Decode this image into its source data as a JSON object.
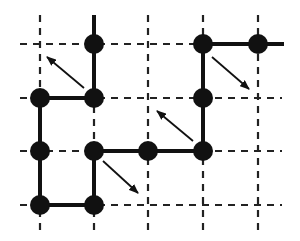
{
  "diagram": {
    "type": "lattice-polymer-chain-moves",
    "colors": {
      "background": "#ffffff",
      "ink": "#111111",
      "grid": "#222222"
    },
    "grid": {
      "columns_x": [
        40,
        94,
        148,
        203,
        258
      ],
      "rows_y": [
        44,
        98,
        151,
        205
      ],
      "x_extent": [
        20,
        282
      ],
      "y_extent": [
        15,
        230
      ],
      "style": "dashed"
    },
    "nodes": [
      {
        "id": "n1",
        "x": 94,
        "y": 44
      },
      {
        "id": "n2",
        "x": 94,
        "y": 98
      },
      {
        "id": "n3",
        "x": 40,
        "y": 98
      },
      {
        "id": "n4",
        "x": 40,
        "y": 151
      },
      {
        "id": "n5",
        "x": 40,
        "y": 205
      },
      {
        "id": "n6",
        "x": 94,
        "y": 205
      },
      {
        "id": "n7",
        "x": 94,
        "y": 151
      },
      {
        "id": "n8",
        "x": 148,
        "y": 151
      },
      {
        "id": "n9",
        "x": 203,
        "y": 151
      },
      {
        "id": "n10",
        "x": 203,
        "y": 98
      },
      {
        "id": "n11",
        "x": 203,
        "y": 44
      },
      {
        "id": "n12",
        "x": 258,
        "y": 44
      }
    ],
    "chain_path": [
      [
        94,
        15
      ],
      [
        94,
        44
      ],
      [
        94,
        98
      ],
      [
        40,
        98
      ],
      [
        40,
        151
      ],
      [
        40,
        205
      ],
      [
        94,
        205
      ],
      [
        94,
        151
      ],
      [
        148,
        151
      ],
      [
        203,
        151
      ],
      [
        203,
        98
      ],
      [
        203,
        44
      ],
      [
        258,
        44
      ],
      [
        284,
        44
      ]
    ],
    "arrows": [
      {
        "id": "a1",
        "from": [
          84,
          88
        ],
        "to": [
          47,
          57
        ]
      },
      {
        "id": "a2",
        "from": [
          212,
          57
        ],
        "to": [
          249,
          89
        ]
      },
      {
        "id": "a3",
        "from": [
          193,
          141
        ],
        "to": [
          157,
          111
        ]
      },
      {
        "id": "a4",
        "from": [
          103,
          161
        ],
        "to": [
          138,
          193
        ]
      }
    ]
  }
}
